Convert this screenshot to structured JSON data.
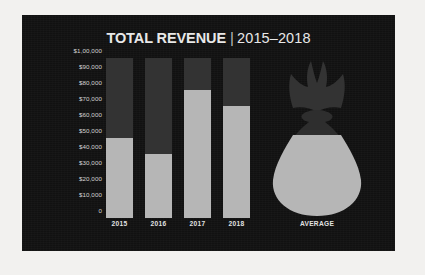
{
  "chart_data": {
    "type": "bar",
    "title_main": "TOTAL REVENUE",
    "title_separator": "|",
    "title_years": "2015–2018",
    "xlabel": "",
    "ylabel": "",
    "ylim": [
      0,
      100000
    ],
    "grid": false,
    "legend": "none",
    "stacked": true,
    "categories": [
      "2015",
      "2016",
      "2017",
      "2018"
    ],
    "values": [
      50000,
      40000,
      80000,
      70000
    ],
    "series": [
      {
        "name": "Revenue",
        "values": [
          50000,
          40000,
          80000,
          70000
        ],
        "color": "#b6b6b6"
      },
      {
        "name": "Remaining to target",
        "values": [
          50000,
          60000,
          20000,
          30000
        ],
        "color": "#333333"
      }
    ],
    "ytick_labels": [
      "$1,00,000",
      "$90,000",
      "$80,000",
      "$70,000",
      "$60,000",
      "$50,000",
      "$40,000",
      "$30,000",
      "$20,000",
      "$10,000",
      "0"
    ],
    "ytick_values": [
      100000,
      90000,
      80000,
      70000,
      60000,
      50000,
      40000,
      30000,
      20000,
      10000,
      0
    ],
    "average_label": "AVERAGE",
    "average_value": 60000,
    "average_fill_percent": 70,
    "colors": {
      "panel_background": "#111111",
      "bar_value": "#b6b6b6",
      "bar_remainder": "#333333",
      "text": "#e2e2e2",
      "axis_text": "#d4d4d4",
      "page_background": "#f2f1ef"
    }
  }
}
